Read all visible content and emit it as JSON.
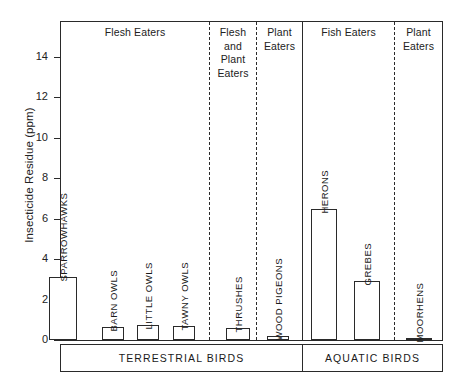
{
  "chart_data": {
    "type": "bar",
    "title": "",
    "xlabel": "",
    "ylabel": "Insecticide Residue (ppm)",
    "ylim": [
      0,
      15.2
    ],
    "yticks": [
      0,
      2,
      4,
      6,
      8,
      10,
      12,
      14
    ],
    "grid": false,
    "legend": "none",
    "categories": [
      "SPARROWHAWKS",
      "BARN OWLS",
      "LITTLE OWLS",
      "TAWNY OWLS",
      "THRUSHES",
      "WOOD PIGEONS",
      "HERONS",
      "GREBES",
      "MOORHENS"
    ],
    "values": [
      3.1,
      0.65,
      0.75,
      0.7,
      0.6,
      0.2,
      6.5,
      2.9,
      0.05
    ],
    "annotations": {
      "diet_groups": [
        {
          "label": "Flesh Eaters",
          "categories": [
            "SPARROWHAWKS",
            "BARN OWLS",
            "LITTLE OWLS",
            "TAWNY OWLS"
          ]
        },
        {
          "label": "Flesh and Plant Eaters",
          "categories": [
            "THRUSHES"
          ]
        },
        {
          "label": "Plant Eaters",
          "categories": [
            "WOOD PIGEONS"
          ]
        },
        {
          "label": "Fish Eaters",
          "categories": [
            "HERONS",
            "GREBES"
          ]
        },
        {
          "label": "Plant Eaters",
          "categories": [
            "MOORHENS"
          ]
        }
      ],
      "habitat_groups": [
        {
          "label": "TERRESTRIAL BIRDS"
        },
        {
          "label": "AQUATIC BIRDS"
        }
      ]
    },
    "colors": {
      "axis": "#2a2a2a",
      "bar_fill": "#ffffff",
      "bar_edge": "#2a2a2a",
      "background": "#ffffff",
      "text": "#1a1a1a"
    }
  },
  "axis": {
    "y_title": "Insecticide Residue (ppm)",
    "ticks": [
      {
        "value": 14,
        "label": "14"
      },
      {
        "value": 12,
        "label": "12"
      },
      {
        "value": 10,
        "label": "10"
      },
      {
        "value": 8,
        "label": "8"
      },
      {
        "value": 6,
        "label": "6"
      },
      {
        "value": 4,
        "label": "4"
      },
      {
        "value": 2,
        "label": "2"
      },
      {
        "value": 0,
        "label": "0"
      }
    ]
  },
  "diet_headers": [
    {
      "id": "flesh-eaters",
      "label": "Flesh Eaters"
    },
    {
      "id": "flesh-and-plant-eaters",
      "label": "Flesh\nand\nPlant\nEaters"
    },
    {
      "id": "plant-eaters-terrestrial",
      "label": "Plant\nEaters"
    },
    {
      "id": "fish-eaters",
      "label": "Fish Eaters"
    },
    {
      "id": "plant-eaters-aquatic",
      "label": "Plant\nEaters"
    }
  ],
  "bars": [
    {
      "id": "sparrowhawks",
      "label": "SPARROWHAWKS",
      "value": 3.1
    },
    {
      "id": "barn-owls",
      "label": "BARN OWLS",
      "value": 0.65
    },
    {
      "id": "little-owls",
      "label": "LITTLE OWLS",
      "value": 0.75
    },
    {
      "id": "tawny-owls",
      "label": "TAWNY OWLS",
      "value": 0.7
    },
    {
      "id": "thrushes",
      "label": "THRUSHES",
      "value": 0.6
    },
    {
      "id": "wood-pigeons",
      "label": "WOOD PIGEONS",
      "value": 0.2
    },
    {
      "id": "herons",
      "label": "HERONS",
      "value": 6.5
    },
    {
      "id": "grebes",
      "label": "GREBES",
      "value": 2.9
    },
    {
      "id": "moorhens",
      "label": "MOORHENS",
      "value": 0.05
    }
  ],
  "habitat_bands": [
    {
      "id": "terrestrial-birds",
      "label": "TERRESTRIAL BIRDS"
    },
    {
      "id": "aquatic-birds",
      "label": "AQUATIC BIRDS"
    }
  ]
}
